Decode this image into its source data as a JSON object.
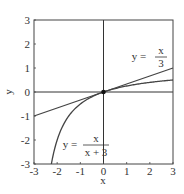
{
  "chart_data": {
    "type": "line",
    "title": "",
    "xlabel": "x",
    "ylabel": "y",
    "xlim": [
      -3,
      3
    ],
    "ylim": [
      -3,
      3
    ],
    "x_ticks": [
      "-3",
      "-2",
      "-1",
      "0",
      "1",
      "2",
      "3"
    ],
    "y_ticks": [
      "-3",
      "-2",
      "-1",
      "0",
      "1",
      "2",
      "3"
    ],
    "grid": false,
    "series": [
      {
        "name": "y = x/3",
        "x": [
          -3,
          -2,
          -1,
          0,
          1,
          2,
          3
        ],
        "values": [
          -1,
          -0.667,
          -0.333,
          0,
          0.333,
          0.667,
          1
        ]
      },
      {
        "name": "y = x/(x+3)",
        "x": [
          -2.25,
          -2,
          -1.5,
          -1,
          -0.5,
          0,
          0.5,
          1,
          1.5,
          2,
          2.5,
          3
        ],
        "values": [
          -3,
          -2,
          -1,
          -0.5,
          -0.2,
          0,
          0.143,
          0.25,
          0.333,
          0.4,
          0.455,
          0.5
        ]
      }
    ],
    "annotations": [
      {
        "text": "y = x/3",
        "near": [
          2.2,
          1.7
        ]
      },
      {
        "text": "y = x/(x+3)",
        "near": [
          -1.2,
          -2.2
        ]
      },
      {
        "text": "point",
        "at": [
          0,
          0
        ]
      }
    ]
  },
  "labels": {
    "xlabel": "x",
    "ylabel": "y",
    "ann1_lhs": "y =",
    "ann1_num": "x",
    "ann1_den": "3",
    "ann2_lhs": "y =",
    "ann2_num": "x",
    "ann2_den": "x + 3"
  }
}
